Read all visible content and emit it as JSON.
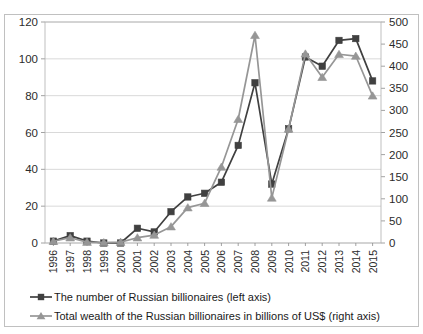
{
  "chart_data": {
    "type": "line",
    "title": "",
    "subtitle": "",
    "xlabel": "",
    "ylabel": "",
    "grid": true,
    "legend_position": "bottom",
    "categories": [
      "1996",
      "1997",
      "1998",
      "1999",
      "2000",
      "2001",
      "2002",
      "2003",
      "2004",
      "2005",
      "2006",
      "2007",
      "2008",
      "2009",
      "2010",
      "2011",
      "2012",
      "2013",
      "2014",
      "2015"
    ],
    "left_axis": {
      "ticks": [
        "0",
        "20",
        "40",
        "60",
        "80",
        "100",
        "120"
      ],
      "ylim": [
        0,
        120
      ],
      "label": "left axis"
    },
    "right_axis": {
      "ticks": [
        "0",
        "50",
        "100",
        "150",
        "200",
        "250",
        "300",
        "350",
        "400",
        "450",
        "500"
      ],
      "ylim": [
        0,
        500
      ],
      "label": "right axis"
    },
    "series": [
      {
        "name": "The number of Russian billionaires (left axis)",
        "axis": "left",
        "marker": "square",
        "color": "#404040",
        "values": [
          1,
          4,
          1,
          0,
          0,
          8,
          6,
          17,
          25,
          27,
          33,
          53,
          87,
          32,
          62,
          101,
          96,
          110,
          111,
          88
        ]
      },
      {
        "name": "Total wealth of the Russian billionaires in billions of US$ (right axis)",
        "axis": "right",
        "marker": "triangle",
        "color": "#969696",
        "values": [
          4,
          12,
          2,
          1,
          2,
          12,
          18,
          37,
          80,
          90,
          172,
          280,
          470,
          102,
          258,
          428,
          375,
          427,
          423,
          333
        ]
      }
    ]
  },
  "legend": {
    "items": [
      {
        "label": "The number of Russian billionaires (left axis)",
        "marker": "square",
        "color": "#404040"
      },
      {
        "label": "Total wealth of the Russian billionaires in billions of US$ (right axis)",
        "marker": "triangle",
        "color": "#969696"
      }
    ]
  }
}
